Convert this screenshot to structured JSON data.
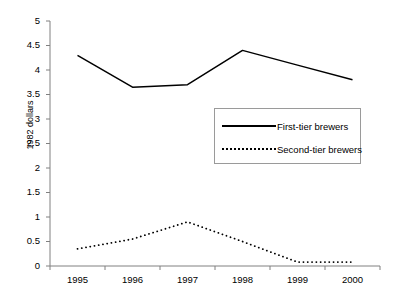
{
  "chart_data": {
    "type": "line",
    "title": "",
    "xlabel": "",
    "ylabel": "1982 dollars",
    "categories": [
      "1995",
      "1996",
      "1997",
      "1998",
      "1999",
      "2000"
    ],
    "ylim": [
      0,
      5
    ],
    "ytick_labels": [
      "5",
      "4.5",
      "4",
      "3.5",
      "3",
      "2.5",
      "2",
      "1.5",
      "1",
      "0.5",
      "0"
    ],
    "ytick_values": [
      5,
      4.5,
      4,
      3.5,
      3,
      2.5,
      2,
      1.5,
      1,
      0.5,
      0
    ],
    "grid": false,
    "legend_position": "inside-upper-right",
    "series": [
      {
        "name": "First-tier brewers",
        "style": "solid",
        "color": "#000000",
        "values": [
          4.3,
          3.65,
          3.7,
          4.4,
          4.1,
          3.8
        ]
      },
      {
        "name": "Second-tier brewers",
        "style": "dotted",
        "color": "#000000",
        "values": [
          0.35,
          0.55,
          0.9,
          0.5,
          0.08,
          0.08
        ]
      }
    ]
  },
  "axis": {
    "y_title": "1982 dollars",
    "y_ticks": [
      {
        "label": "5"
      },
      {
        "label": "4.5"
      },
      {
        "label": "4"
      },
      {
        "label": "3.5"
      },
      {
        "label": "3"
      },
      {
        "label": "2.5"
      },
      {
        "label": "2"
      },
      {
        "label": "1.5"
      },
      {
        "label": "1"
      },
      {
        "label": "0.5"
      },
      {
        "label": "0"
      }
    ],
    "x_ticks": [
      {
        "label": "1995"
      },
      {
        "label": "1996"
      },
      {
        "label": "1997"
      },
      {
        "label": "1998"
      },
      {
        "label": "1999"
      },
      {
        "label": "2000"
      }
    ]
  },
  "legend": {
    "entries": [
      {
        "label": "First-tier brewers",
        "style": "solid"
      },
      {
        "label": "Second-tier brewers",
        "style": "dotted"
      }
    ]
  },
  "colors": {
    "series_line": "#000000",
    "axis_line": "#808080",
    "legend_border": "#9a9a9a",
    "background": "#ffffff"
  }
}
